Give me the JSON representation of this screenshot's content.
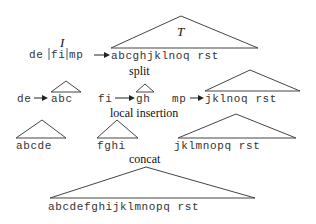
{
  "diagram": {
    "row1": {
      "tree_label": "T",
      "input_label": "I",
      "input_parts": [
        "de",
        "fi",
        "mp"
      ],
      "input_text": "de|fi|mp",
      "tree_leaves": "abcghjklnoq rst",
      "step_label": "split"
    },
    "row2": {
      "pairs": [
        {
          "key": "de",
          "leaves": "abc"
        },
        {
          "key": "fi",
          "leaves": "gh"
        },
        {
          "key": "mp",
          "leaves": "jklnoq rst"
        }
      ],
      "step_label": "local insertion"
    },
    "row3": {
      "trees": [
        {
          "leaves": "abcde"
        },
        {
          "leaves": "fghi"
        },
        {
          "leaves": "jklmnopq rst"
        }
      ],
      "step_label": "concat"
    },
    "row4": {
      "tree_leaves": "abcdefghijklmnopq rst"
    }
  }
}
